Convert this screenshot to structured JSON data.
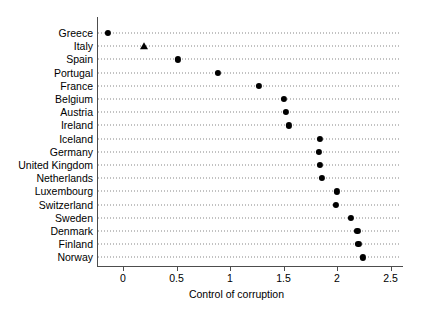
{
  "chart_data": {
    "type": "scatter",
    "title": "",
    "subtitle": "",
    "xlabel": "Control of corruption",
    "ylabel": "",
    "xlim": [
      -0.27,
      2.61
    ],
    "ylim": [
      0,
      18
    ],
    "grid": "horizontal dotted guide lines per category",
    "legend": "none",
    "orientation": "horizontal dot plot",
    "xticks": [
      "0",
      "0.5",
      "1",
      "1.5",
      "2",
      "2.5"
    ],
    "xtick_values": [
      0,
      0.5,
      1,
      1.5,
      2,
      2.5
    ],
    "categories": [
      "Greece",
      "Italy",
      "Spain",
      "Portugal",
      "France",
      "Belgium",
      "Austria",
      "Ireland",
      "Iceland",
      "Germany",
      "United Kingdom",
      "Netherlands",
      "Luxembourg",
      "Switzerland",
      "Sweden",
      "Denmark",
      "Finland",
      "Norway"
    ],
    "values": [
      -0.14,
      0.2,
      0.51,
      0.89,
      1.27,
      1.5,
      1.52,
      1.55,
      1.84,
      1.83,
      1.84,
      1.86,
      2.0,
      1.99,
      2.13,
      2.19,
      2.2,
      2.24
    ],
    "markers": [
      "circle",
      "triangle",
      "circle",
      "circle",
      "circle",
      "circle",
      "circle",
      "circle",
      "circle",
      "circle",
      "circle",
      "circle",
      "circle",
      "circle",
      "circle",
      "circle",
      "circle",
      "circle"
    ],
    "marker_color": "#000000",
    "guide_color": "#555555",
    "axis_color": "#4d4d4d",
    "background": "#ffffff"
  }
}
